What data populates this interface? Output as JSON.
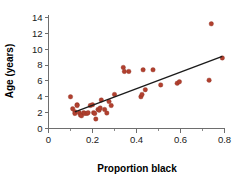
{
  "chart_data": {
    "type": "scatter",
    "title": "",
    "xlabel": "Proportion black",
    "ylabel": "Age (years)",
    "xlim": [
      0,
      0.8
    ],
    "ylim": [
      0,
      14
    ],
    "xticks": [
      0,
      0.2,
      0.4,
      0.6,
      0.8
    ],
    "xtick_labels": [
      "0",
      "0.2",
      "0.4",
      "0.6",
      "0.8"
    ],
    "xminor_ticks": [
      0.1,
      0.3,
      0.5,
      0.7
    ],
    "yticks": [
      0,
      2,
      4,
      6,
      8,
      10,
      12,
      14
    ],
    "ytick_labels": [
      "0",
      "2",
      "4",
      "6",
      "8",
      "10",
      "12",
      "14"
    ],
    "grid": false,
    "legend": null,
    "point_color": "#b1402f",
    "point_edge_color": "#8d3224",
    "line_color": "#1b1b1b",
    "axis_color": "#6e6e6e",
    "series": [
      {
        "name": "observations",
        "marker": "circle",
        "points": [
          [
            0.1,
            4.0
          ],
          [
            0.11,
            2.5
          ],
          [
            0.12,
            2.1
          ],
          [
            0.12,
            1.9
          ],
          [
            0.13,
            3.0
          ],
          [
            0.13,
            2.9
          ],
          [
            0.14,
            2.0
          ],
          [
            0.145,
            1.7
          ],
          [
            0.15,
            1.6
          ],
          [
            0.16,
            2.0
          ],
          [
            0.165,
            1.9
          ],
          [
            0.175,
            1.9
          ],
          [
            0.18,
            2.0
          ],
          [
            0.19,
            2.9
          ],
          [
            0.2,
            3.0
          ],
          [
            0.205,
            2.0
          ],
          [
            0.21,
            1.9
          ],
          [
            0.215,
            1.2
          ],
          [
            0.225,
            2.4
          ],
          [
            0.23,
            2.3
          ],
          [
            0.235,
            2.6
          ],
          [
            0.24,
            3.6
          ],
          [
            0.255,
            2.4
          ],
          [
            0.265,
            1.95
          ],
          [
            0.275,
            3.4
          ],
          [
            0.285,
            2.9
          ],
          [
            0.3,
            4.3
          ],
          [
            0.34,
            7.7
          ],
          [
            0.345,
            7.2
          ],
          [
            0.365,
            7.2
          ],
          [
            0.42,
            4.0
          ],
          [
            0.425,
            4.3
          ],
          [
            0.43,
            7.4
          ],
          [
            0.44,
            4.9
          ],
          [
            0.475,
            7.4
          ],
          [
            0.51,
            5.5
          ],
          [
            0.585,
            5.7
          ],
          [
            0.595,
            5.9
          ],
          [
            0.73,
            6.1
          ],
          [
            0.74,
            13.2
          ],
          [
            0.79,
            8.9
          ]
        ]
      }
    ],
    "trend_line": {
      "name": "least-squares fit",
      "x_start": 0.12,
      "y_start": 2.1,
      "x_end": 0.79,
      "y_end": 9.1
    }
  }
}
